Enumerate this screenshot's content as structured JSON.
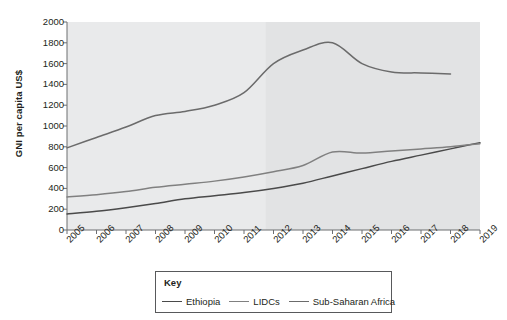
{
  "chart_data": {
    "type": "line",
    "title": "",
    "xlabel": "",
    "ylabel": "GNI per capita US$",
    "xlim": [
      2005,
      2019
    ],
    "ylim": [
      0,
      2000
    ],
    "grid": false,
    "legend_position": "bottom",
    "legend_title": "Key",
    "x": [
      2005,
      2006,
      2007,
      2008,
      2009,
      2010,
      2011,
      2012,
      2013,
      2014,
      2015,
      2016,
      2017,
      2018,
      2019
    ],
    "yticks": [
      0,
      200,
      400,
      600,
      800,
      1000,
      1200,
      1400,
      1600,
      1800,
      2000
    ],
    "xticks": [
      "2005",
      "2006",
      "2007",
      "2008",
      "2009",
      "2010",
      "2011",
      "2012",
      "2013",
      "2014",
      "2015",
      "2016",
      "2017",
      "2018",
      "2019"
    ],
    "series": [
      {
        "name": "Ethiopia",
        "color": "#4a4a4a",
        "values": [
          155,
          180,
          215,
          255,
          300,
          330,
          360,
          400,
          450,
          520,
          590,
          660,
          720,
          780,
          840
        ]
      },
      {
        "name": "LIDCs",
        "color": "#808080",
        "values": [
          317,
          340,
          370,
          410,
          440,
          470,
          510,
          560,
          620,
          750,
          740,
          760,
          780,
          800,
          830
        ]
      },
      {
        "name": "Sub-Saharan Africa",
        "color": "#6b6b6b",
        "values": [
          790,
          890,
          990,
          1100,
          1140,
          1200,
          1320,
          1600,
          1730,
          1800,
          1600,
          1520,
          1510,
          1500,
          null
        ]
      }
    ]
  },
  "legend": {
    "title": "Key",
    "entries": [
      {
        "label": "Ethiopia"
      },
      {
        "label": "LIDCs"
      },
      {
        "label": "Sub-Saharan Africa"
      }
    ]
  }
}
